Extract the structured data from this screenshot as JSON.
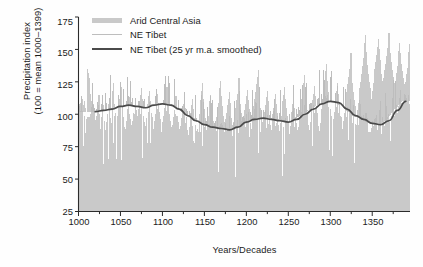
{
  "chart_data": {
    "type": "bar",
    "title": "",
    "xlabel": "Years/Decades",
    "ylabel_line1": "Precipitation index",
    "ylabel_line2": "(100 = mean 1000–1399)",
    "xlim": [
      1000,
      1395
    ],
    "ylim": [
      25,
      175
    ],
    "yticks": [
      25,
      50,
      75,
      100,
      125,
      150,
      175
    ],
    "xticks": [
      1000,
      1050,
      1100,
      1150,
      1200,
      1250,
      1300,
      1350
    ],
    "xminorticks": [
      1025,
      1075,
      1125,
      1175,
      1225,
      1275,
      1325,
      1375
    ],
    "grid": false,
    "legend_position": "top-left",
    "legend": [
      {
        "label": "Arid Central Asia",
        "marker": "area-swatch",
        "color": "#c9c9c9"
      },
      {
        "label": "NE Tibet",
        "marker": "thin-line",
        "color": "#bdbdbd"
      },
      {
        "label": "NE Tibet (25 yr m.a. smoothed)",
        "marker": "thick-line",
        "color": "#4a4a4a"
      }
    ],
    "series": [
      {
        "name": "Arid Central Asia",
        "type": "bar",
        "color": "#c9c9c9",
        "x_start": 1000,
        "x_step": 1,
        "values": [
          108,
          106,
          109,
          104,
          112,
          107,
          103,
          110,
          105,
          102,
          135,
          132,
          128,
          120,
          116,
          110,
          113,
          108,
          104,
          100,
          101,
          99,
          104,
          110,
          115,
          96,
          92,
          98,
          103,
          107,
          95,
          90,
          88,
          94,
          100,
          105,
          108,
          102,
          97,
          93,
          112,
          118,
          124,
          108,
          101,
          97,
          99,
          103,
          108,
          112,
          116,
          121,
          106,
          98,
          94,
          91,
          89,
          95,
          100,
          104,
          108,
          113,
          96,
          92,
          88,
          95,
          101,
          107,
          112,
          103,
          99,
          96,
          104,
          109,
          115,
          120,
          112,
          105,
          99,
          94,
          91,
          97,
          102,
          108,
          114,
          118,
          110,
          104,
          98,
          93,
          89,
          95,
          100,
          106,
          111,
          116,
          108,
          102,
          96,
          92,
          88,
          94,
          99,
          105,
          110,
          115,
          121,
          113,
          106,
          100,
          95,
          90,
          86,
          92,
          98,
          103,
          109,
          114,
          106,
          99,
          94,
          89,
          85,
          91,
          97,
          102,
          108,
          113,
          105,
          98,
          93,
          88,
          84,
          90,
          96,
          101,
          107,
          112,
          104,
          97,
          92,
          87,
          83,
          89,
          95,
          100,
          106,
          111,
          118,
          124,
          112,
          104,
          97,
          92,
          88,
          94,
          99,
          105,
          110,
          115,
          107,
          100,
          95,
          90,
          86,
          92,
          98,
          103,
          109,
          114,
          120,
          126,
          114,
          106,
          99,
          94,
          90,
          96,
          101,
          107,
          112,
          117,
          109,
          102,
          97,
          92,
          88,
          94,
          100,
          105,
          111,
          116,
          122,
          128,
          116,
          108,
          101,
          96,
          91,
          97,
          103,
          108,
          114,
          119,
          111,
          104,
          98,
          93,
          89,
          95,
          101,
          106,
          112,
          117,
          123,
          129,
          134,
          121,
          112,
          105,
          99,
          94,
          90,
          96,
          102,
          107,
          113,
          118,
          110,
          103,
          97,
          92,
          88,
          94,
          100,
          105,
          111,
          116,
          108,
          101,
          96,
          91,
          87,
          93,
          99,
          104,
          110,
          115,
          121,
          112,
          105,
          99,
          94,
          89,
          85,
          91,
          97,
          102,
          108,
          113,
          105,
          98,
          93,
          88,
          84,
          90,
          96,
          101,
          107,
          112,
          118,
          124,
          130,
          118,
          110,
          103,
          97,
          92,
          88,
          94,
          100,
          105,
          111,
          116,
          122,
          114,
          107,
          101,
          96,
          91,
          87,
          93,
          99,
          104,
          110,
          115,
          121,
          127,
          133,
          139,
          126,
          117,
          110,
          104,
          99,
          94,
          90,
          96,
          102,
          107,
          113,
          118,
          124,
          116,
          109,
          103,
          98,
          93,
          89,
          95,
          101,
          106,
          112,
          117,
          123,
          129,
          135,
          141,
          147,
          134,
          124,
          117,
          111,
          106,
          101,
          97,
          103,
          109,
          114,
          120,
          125,
          131,
          137,
          143,
          149,
          155,
          161,
          148,
          138,
          131,
          125,
          120,
          116,
          112,
          118,
          124,
          129,
          135,
          140,
          146,
          152,
          158,
          150,
          142,
          136,
          131,
          126,
          122,
          128,
          134,
          139,
          145,
          151,
          157,
          163,
          155,
          147,
          140,
          134,
          129,
          124,
          120,
          126,
          132,
          137,
          143,
          149,
          155,
          147,
          139,
          133,
          128,
          123,
          119,
          125,
          131,
          136,
          142,
          148,
          154
        ]
      },
      {
        "name": "NE Tibet",
        "type": "line",
        "color": "#bdbdbd",
        "note": "annual high-frequency series drawn as thin spikes over the bar field"
      },
      {
        "name": "NE Tibet (25 yr m.a. smoothed)",
        "type": "line",
        "color": "#4a4a4a",
        "x": [
          1020,
          1030,
          1040,
          1050,
          1060,
          1070,
          1080,
          1090,
          1100,
          1110,
          1120,
          1130,
          1140,
          1150,
          1160,
          1170,
          1180,
          1190,
          1200,
          1210,
          1220,
          1230,
          1240,
          1250,
          1260,
          1270,
          1280,
          1290,
          1300,
          1310,
          1320,
          1330,
          1340,
          1350,
          1360,
          1370,
          1380,
          1390
        ],
        "values": [
          102,
          103,
          104,
          106,
          107,
          106,
          105,
          107,
          108,
          107,
          104,
          99,
          95,
          92,
          90,
          89,
          88,
          90,
          94,
          96,
          97,
          96,
          95,
          94,
          96,
          100,
          104,
          108,
          110,
          109,
          104,
          99,
          96,
          93,
          92,
          95,
          103,
          110
        ]
      }
    ]
  }
}
